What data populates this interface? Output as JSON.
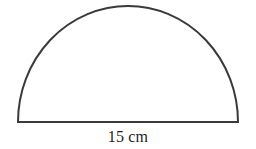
{
  "figure": {
    "name": "semicircle-diagram",
    "shape_type": "semicircle",
    "stroke_color": "#3a3a3a",
    "fill_color": "#ffffff",
    "background_color": "#ffffff",
    "stroke_width": 2,
    "geometry": {
      "center_x": 128,
      "baseline_y": 122,
      "radius_x": 110,
      "radius_y": 116,
      "left_x": 18,
      "right_x": 238,
      "apex_y": 6
    }
  },
  "labels": {
    "diameter": {
      "value": "15",
      "unit": "cm",
      "text": "15 cm",
      "position": "below-baseline"
    }
  },
  "chart_data": {
    "type": "diagram",
    "title": "",
    "shape": "semicircle",
    "annotations": [
      {
        "target": "diameter",
        "text": "15 cm",
        "value": 15,
        "unit": "cm"
      }
    ]
  }
}
